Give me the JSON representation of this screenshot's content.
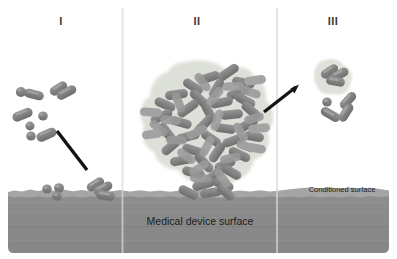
{
  "figure": {
    "type": "diagram",
    "width": 397,
    "height": 259,
    "background_color": "#ffffff"
  },
  "stages": [
    {
      "id": "stage-1",
      "label": "I",
      "name": "attachment",
      "label_x": 61,
      "label_y": 22,
      "description": "Planktonic rod and coccus shaped bacteria approaching and reversibly attaching to the conditioned surface"
    },
    {
      "id": "stage-2",
      "label": "II",
      "name": "maturation",
      "label_x": 197,
      "label_y": 22,
      "description": "Mature biofilm microcolony encased in an extracellular polymeric substance matrix anchored to the surface"
    },
    {
      "id": "stage-3",
      "label": "III",
      "name": "dispersal",
      "label_x": 333,
      "label_y": 22,
      "description": "Detachment and dispersal of cell clusters and single cells from the mature biofilm"
    }
  ],
  "dividers": [
    {
      "name": "divider-1-2",
      "x": 122.5,
      "color": "#e3e3e3"
    },
    {
      "name": "divider-2-3",
      "x": 277.0,
      "color": "#e3e3e3"
    }
  ],
  "surface": {
    "device_label": "Medical device surface",
    "device_label_x": 200,
    "device_label_y": 222,
    "conditioned_label": "Conditioned surface",
    "conditioned_label_x": 342,
    "conditioned_label_y": 190,
    "slab_color": "#8a8a8a",
    "conditioning_film_color": "#a3a3a3",
    "top_y": 190,
    "bottom_y": 253,
    "left_x": 8,
    "right_x": 389
  },
  "colors": {
    "bacteria_body": "#7b7b7b",
    "bacteria_highlight": "#9b9b9b",
    "bacteria_outline": "#6a6a6a",
    "eps_matrix": "#d9dbd4",
    "arrow": "#1a1a1a",
    "label_text": "#3a3a3a",
    "surface_text": "#1c1c1c"
  },
  "arrows": [
    {
      "name": "arrow-attachment",
      "stage": "I",
      "x1": 57,
      "y1": 131,
      "x2": 87,
      "y2": 170,
      "arrowhead": false,
      "color": "#1a1a1a"
    },
    {
      "name": "arrow-dispersal",
      "stage": "III",
      "x1": 264,
      "y1": 112,
      "x2": 299,
      "y2": 85,
      "arrowhead": true,
      "color": "#1a1a1a"
    }
  ],
  "elements": {
    "planktonic_cells_stage1": 12,
    "attached_cells_stage1": 6,
    "biofilm_cells_stage2": 86,
    "dispersed_cells_stage3": 8,
    "eps_halos": 2
  }
}
